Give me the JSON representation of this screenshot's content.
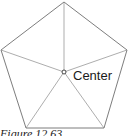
{
  "figure": {
    "caption": "Figure 12.63",
    "center_label": "Center",
    "shape": "regular pentagon",
    "vertices": [
      {
        "x": 64,
        "y": 2
      },
      {
        "x": 127,
        "y": 50
      },
      {
        "x": 104,
        "y": 128
      },
      {
        "x": 26,
        "y": 128
      },
      {
        "x": 1,
        "y": 50
      }
    ],
    "center": {
      "x": 64,
      "y": 72,
      "r": 2
    },
    "colors": {
      "edge": "#6e6e6e",
      "spoke": "#8a8a8a",
      "text": "#1a1a1a"
    }
  }
}
